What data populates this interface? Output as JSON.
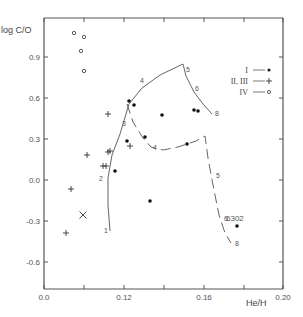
{
  "chart_data": {
    "type": "scatter",
    "title": "",
    "xlabel": "He/H",
    "ylabel": "log C/O",
    "xlim": [
      0.08,
      0.2
    ],
    "ylim": [
      -0.84,
      1.14
    ],
    "grid": false,
    "legend_position": "upper right",
    "x_ticks": [
      {
        "value": 0.08,
        "label": "0.0",
        "px": 44
      },
      {
        "value": 0.1,
        "label": "",
        "px": 84
      },
      {
        "value": 0.12,
        "label": "0.12",
        "px": 124
      },
      {
        "value": 0.14,
        "label": "",
        "px": 164
      },
      {
        "value": 0.16,
        "label": "0.16",
        "px": 204
      },
      {
        "value": 0.18,
        "label": "",
        "px": 244
      },
      {
        "value": 0.2,
        "label": "0.20",
        "px": 283
      }
    ],
    "y_ticks": [
      {
        "value": 0.9,
        "label": "0.9",
        "py": 57
      },
      {
        "value": 0.6,
        "label": "0.6",
        "py": 98
      },
      {
        "value": 0.3,
        "label": "0.3",
        "py": 139
      },
      {
        "value": 0.0,
        "label": "0.0",
        "py": 180
      },
      {
        "value": -0.3,
        "label": "-0.3",
        "py": 221
      },
      {
        "value": -0.6,
        "label": "-0.6",
        "py": 262
      }
    ],
    "legend": [
      {
        "label": "I",
        "marker": "filled-circle"
      },
      {
        "label": "II, III",
        "marker": "plus"
      },
      {
        "label": "IV",
        "marker": "open-circle"
      }
    ],
    "series": [
      {
        "name": "I",
        "marker": "filled-circle",
        "points": [
          {
            "x": 0.119,
            "y": 0.04,
            "px": 115,
            "py": 171
          },
          {
            "x": 0.123,
            "y": 0.58,
            "px": 129,
            "py": 101
          },
          {
            "x": 0.126,
            "y": 0.55,
            "px": 134,
            "py": 105
          },
          {
            "x": 0.124,
            "y": 0.27,
            "px": 127,
            "py": 141
          },
          {
            "x": 0.13,
            "y": 0.31,
            "px": 145,
            "py": 137
          },
          {
            "x": 0.137,
            "y": 0.48,
            "px": 162,
            "py": 115
          },
          {
            "x": 0.132,
            "y": -0.13,
            "px": 150,
            "py": 201
          },
          {
            "x": 0.152,
            "y": 0.51,
            "px": 194,
            "py": 110
          },
          {
            "x": 0.154,
            "y": 0.5,
            "px": 198,
            "py": 111
          },
          {
            "x": 0.151,
            "y": 0.27,
            "px": 187,
            "py": 144
          },
          {
            "x": 0.176,
            "y": -0.31,
            "px": 237,
            "py": 226,
            "label": "6302"
          }
        ]
      },
      {
        "name": "II, III",
        "marker": "plus",
        "points": [
          {
            "x": 0.102,
            "y": -0.39,
            "px": 66,
            "py": 233
          },
          {
            "x": 0.103,
            "y": -0.05,
            "px": 71,
            "py": 189
          },
          {
            "x": 0.105,
            "y": 0.18,
            "px": 87,
            "py": 155
          },
          {
            "x": 0.116,
            "y": 0.1,
            "px": 106,
            "py": 166
          },
          {
            "x": 0.116,
            "y": 0.1,
            "px": 103,
            "py": 166
          },
          {
            "x": 0.117,
            "y": 0.21,
            "px": 108,
            "py": 152
          },
          {
            "x": 0.118,
            "y": 0.22,
            "px": 110,
            "py": 151
          },
          {
            "x": 0.118,
            "y": 0.5,
            "px": 108,
            "py": 114
          },
          {
            "x": 0.124,
            "y": 0.26,
            "px": 130,
            "py": 146
          }
        ]
      },
      {
        "name": "IV",
        "marker": "open-circle",
        "points": [
          {
            "x": 0.095,
            "y": 1.03,
            "px": 74,
            "py": 33
          },
          {
            "x": 0.099,
            "y": 1.0,
            "px": 84,
            "py": 37
          },
          {
            "x": 0.098,
            "y": 0.92,
            "px": 81,
            "py": 51
          },
          {
            "x": 0.099,
            "y": 0.8,
            "px": 84,
            "py": 71
          }
        ]
      },
      {
        "name": "X",
        "marker": "cross",
        "points": [
          {
            "x": 0.1,
            "y": -0.24,
            "px": 83,
            "py": 215
          }
        ]
      }
    ],
    "curves": [
      {
        "name": "solid-track",
        "style": "solid",
        "points_px": [
          [
            110,
            231
          ],
          [
            108,
            205
          ],
          [
            108,
            178
          ],
          [
            112,
            155
          ],
          [
            120,
            134
          ],
          [
            129,
            104
          ],
          [
            142,
            88
          ],
          [
            160,
            75
          ],
          [
            183,
            64
          ],
          [
            186,
            76
          ],
          [
            194,
            92
          ],
          [
            203,
            104
          ],
          [
            212,
            114
          ]
        ],
        "tick_labels": [
          {
            "label": "1",
            "px": 104,
            "py": 231
          },
          {
            "label": "2",
            "px": 99,
            "py": 179
          },
          {
            "label": "3",
            "px": 122,
            "py": 124
          },
          {
            "label": "4",
            "px": 140,
            "py": 81
          },
          {
            "label": "5",
            "px": 186,
            "py": 70
          },
          {
            "label": "6",
            "px": 195,
            "py": 89
          },
          {
            "label": "8",
            "px": 215,
            "py": 114
          }
        ]
      },
      {
        "name": "dashed-track",
        "style": "dashed",
        "points_px": [
          [
            127,
            104
          ],
          [
            133,
            122
          ],
          [
            143,
            138
          ],
          [
            151,
            147
          ],
          [
            163,
            150
          ],
          [
            178,
            147
          ],
          [
            196,
            141
          ],
          [
            205,
            136
          ],
          [
            208,
            158
          ],
          [
            213,
            185
          ],
          [
            219,
            215
          ],
          [
            225,
            233
          ],
          [
            231,
            243
          ]
        ],
        "tick_labels": [
          {
            "label": "4",
            "px": 153,
            "py": 148
          },
          {
            "label": "5",
            "px": 216,
            "py": 176
          },
          {
            "label": "6",
            "px": 224,
            "py": 219
          },
          {
            "label": "8",
            "px": 235,
            "py": 244
          }
        ]
      }
    ]
  }
}
